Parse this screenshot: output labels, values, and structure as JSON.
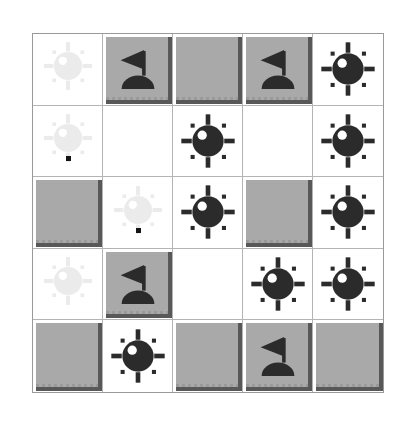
{
  "app": {
    "title": "Minesweeper Board",
    "board_label": "5x5 minefield"
  },
  "legend": {
    "mine_icon": "mine-icon",
    "flag_icon": "flag-icon",
    "covered_icon": "covered-tile",
    "blank_icon": "blank-cell",
    "ghost_icon": "ghost-mine-watermark"
  },
  "colors": {
    "tile_face": "#a9a9a9",
    "tile_shadow": "#585858",
    "revealed_bg": "#ffffff",
    "grid_line": "#b4b4b4",
    "border": "#9a9a9a",
    "glyph": "#2b2b2b",
    "highlight": "#ffffff"
  },
  "board": {
    "rows": 5,
    "cols": 5,
    "cells": [
      [
        {
          "state": "blank",
          "ghost": true,
          "dot": false,
          "label": "r1c1 blank"
        },
        {
          "state": "flag",
          "ghost": false,
          "dot": false,
          "label": "r1c2 flag"
        },
        {
          "state": "covered",
          "ghost": false,
          "dot": false,
          "label": "r1c3 covered"
        },
        {
          "state": "flag",
          "ghost": false,
          "dot": false,
          "label": "r1c4 flag"
        },
        {
          "state": "mine",
          "ghost": false,
          "dot": false,
          "label": "r1c5 mine"
        }
      ],
      [
        {
          "state": "blank",
          "ghost": true,
          "dot": true,
          "label": "r2c1 blank"
        },
        {
          "state": "blank",
          "ghost": false,
          "dot": false,
          "label": "r2c2 blank"
        },
        {
          "state": "mine",
          "ghost": false,
          "dot": false,
          "label": "r2c3 mine"
        },
        {
          "state": "blank",
          "ghost": false,
          "dot": false,
          "label": "r2c4 blank"
        },
        {
          "state": "mine",
          "ghost": false,
          "dot": false,
          "label": "r2c5 mine"
        }
      ],
      [
        {
          "state": "covered",
          "ghost": false,
          "dot": false,
          "label": "r3c1 covered"
        },
        {
          "state": "blank",
          "ghost": true,
          "dot": true,
          "label": "r3c2 blank"
        },
        {
          "state": "mine",
          "ghost": false,
          "dot": false,
          "label": "r3c3 mine"
        },
        {
          "state": "covered",
          "ghost": false,
          "dot": false,
          "label": "r3c4 covered"
        },
        {
          "state": "mine",
          "ghost": false,
          "dot": false,
          "label": "r3c5 mine"
        }
      ],
      [
        {
          "state": "blank",
          "ghost": true,
          "dot": false,
          "label": "r4c1 blank"
        },
        {
          "state": "flag",
          "ghost": false,
          "dot": false,
          "label": "r4c2 flag"
        },
        {
          "state": "blank",
          "ghost": false,
          "dot": false,
          "label": "r4c3 blank"
        },
        {
          "state": "mine",
          "ghost": false,
          "dot": false,
          "label": "r4c4 mine"
        },
        {
          "state": "mine",
          "ghost": false,
          "dot": false,
          "label": "r4c5 mine"
        }
      ],
      [
        {
          "state": "covered",
          "ghost": false,
          "dot": false,
          "label": "r5c1 covered"
        },
        {
          "state": "mine",
          "ghost": false,
          "dot": false,
          "label": "r5c2 mine"
        },
        {
          "state": "covered",
          "ghost": false,
          "dot": false,
          "label": "r5c3 covered"
        },
        {
          "state": "flag",
          "ghost": false,
          "dot": false,
          "label": "r5c4 flag"
        },
        {
          "state": "covered",
          "ghost": false,
          "dot": false,
          "label": "r5c5 covered"
        }
      ]
    ]
  }
}
